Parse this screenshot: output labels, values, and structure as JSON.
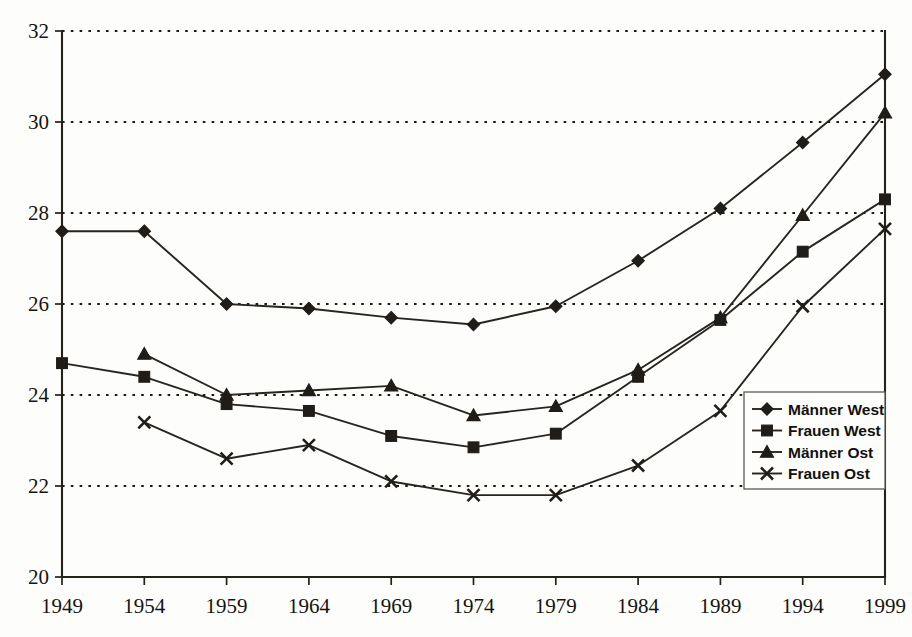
{
  "chart_data": {
    "type": "line",
    "title": "",
    "subtitle": "",
    "xlabel": "",
    "ylabel": "",
    "categories": [
      "1949",
      "1954",
      "1959",
      "1964",
      "1969",
      "1974",
      "1979",
      "1984",
      "1989",
      "1994",
      "1999"
    ],
    "x": [
      1949,
      1954,
      1959,
      1964,
      1969,
      1974,
      1979,
      1984,
      1989,
      1994,
      1999
    ],
    "xlim": [
      1949,
      1999
    ],
    "ylim": [
      20,
      32
    ],
    "y_ticks": [
      "20",
      "22",
      "24",
      "26",
      "28",
      "30",
      "32"
    ],
    "y_tick_values": [
      20,
      22,
      24,
      26,
      28,
      30,
      32
    ],
    "grid": "horizontal-dotted",
    "legend_position": "bottom-right",
    "series": [
      {
        "name": "Männer West",
        "marker": "diamond",
        "values": [
          27.6,
          27.6,
          26.0,
          25.9,
          25.7,
          25.55,
          25.95,
          26.95,
          28.1,
          29.55,
          31.05
        ]
      },
      {
        "name": "Frauen West",
        "marker": "square",
        "values": [
          24.7,
          24.4,
          23.8,
          23.65,
          23.1,
          22.85,
          23.15,
          24.4,
          25.65,
          27.15,
          28.3
        ]
      },
      {
        "name": "Männer Ost",
        "marker": "triangle",
        "values": [
          null,
          24.9,
          24.0,
          24.1,
          24.2,
          23.55,
          23.75,
          24.55,
          25.7,
          27.95,
          30.2
        ]
      },
      {
        "name": "Frauen Ost",
        "marker": "cross",
        "values": [
          null,
          23.4,
          22.6,
          22.9,
          22.1,
          21.8,
          21.8,
          22.45,
          23.65,
          25.95,
          27.65
        ]
      }
    ]
  },
  "legend": {
    "entries": [
      {
        "label": "Männer West"
      },
      {
        "label": "Frauen West"
      },
      {
        "label": "Männer Ost"
      },
      {
        "label": "Frauen Ost"
      }
    ]
  },
  "colors": {
    "background": "#fdfdfb",
    "ink": "#201d18",
    "axis": "#242219",
    "grid": "#1c1a13"
  }
}
